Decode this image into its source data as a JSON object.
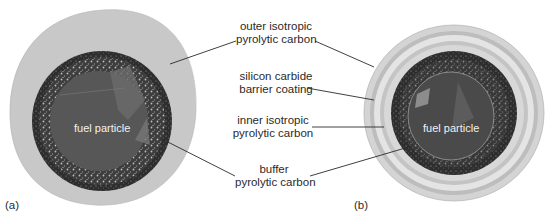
{
  "figure": {
    "panels": [
      {
        "id": "a",
        "label": "(a)",
        "center_label": "fuel particle"
      },
      {
        "id": "b",
        "label": "(b)",
        "center_label": "fuel particle"
      }
    ],
    "callouts": [
      {
        "line1": "outer isotropic",
        "line2": "pyrolytic carbon"
      },
      {
        "line1": "silicon carbide",
        "line2": "barrier coating"
      },
      {
        "line1": "inner isotropic",
        "line2": "pyrolytic carbon"
      },
      {
        "line1": "buffer",
        "line2": "pyrolytic carbon"
      }
    ],
    "colors": {
      "outer_layer": "#c9c9c9",
      "sic_layer": "#e2e2e2",
      "inner_layer": "#d0d0d0",
      "buffer_layer": "#3a3a3a",
      "kernel": "#555555",
      "leader_line": "#2a2a2a"
    }
  }
}
